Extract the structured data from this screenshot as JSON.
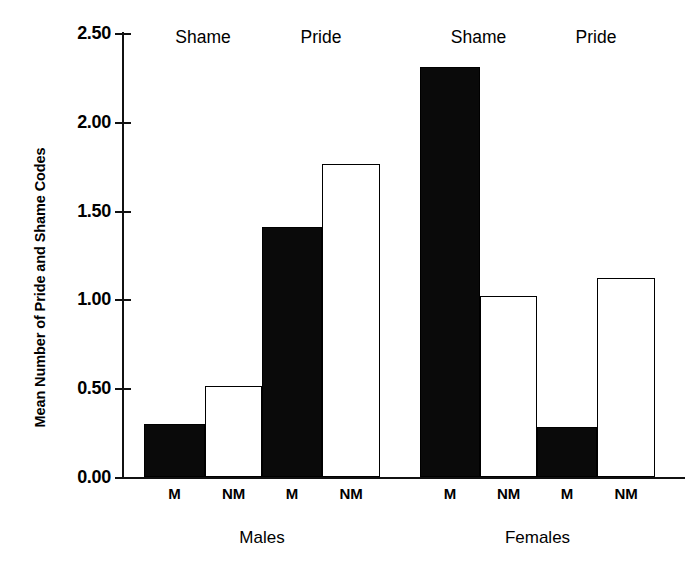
{
  "chart_data": {
    "type": "bar",
    "title": "",
    "xlabel": "",
    "ylabel": "Mean Number of Pride and Shame Codes",
    "ylim": [
      0,
      2.5
    ],
    "ytick_labels": [
      "2.50",
      "2.00",
      "1.50",
      "1.00",
      "0.50",
      "0.00"
    ],
    "ytick_values": [
      2.5,
      2.0,
      1.5,
      1.0,
      0.5,
      0.0
    ],
    "grid": false,
    "legend": "none",
    "groups": [
      {
        "label": "Males",
        "emotions": [
          {
            "label": "Shame",
            "bars": [
              {
                "category": "M",
                "value": 0.3,
                "style": "filled"
              },
              {
                "category": "NM",
                "value": 0.51,
                "style": "open"
              }
            ]
          },
          {
            "label": "Pride",
            "bars": [
              {
                "category": "M",
                "value": 1.41,
                "style": "filled"
              },
              {
                "category": "NM",
                "value": 1.76,
                "style": "open"
              }
            ]
          }
        ]
      },
      {
        "label": "Females",
        "emotions": [
          {
            "label": "Shame",
            "bars": [
              {
                "category": "M",
                "value": 2.31,
                "style": "filled"
              },
              {
                "category": "NM",
                "value": 1.02,
                "style": "open"
              }
            ]
          },
          {
            "label": "Pride",
            "bars": [
              {
                "category": "M",
                "value": 0.28,
                "style": "filled"
              },
              {
                "category": "NM",
                "value": 1.12,
                "style": "open"
              }
            ]
          }
        ]
      }
    ],
    "categories": [
      "M",
      "NM",
      "M",
      "NM",
      "M",
      "NM",
      "M",
      "NM"
    ],
    "values": [
      0.3,
      0.51,
      1.41,
      1.76,
      2.31,
      1.02,
      0.28,
      1.12
    ],
    "colors": {
      "filled": "#0a0a0a",
      "open": "#ffffff",
      "outline": "#000000"
    }
  }
}
